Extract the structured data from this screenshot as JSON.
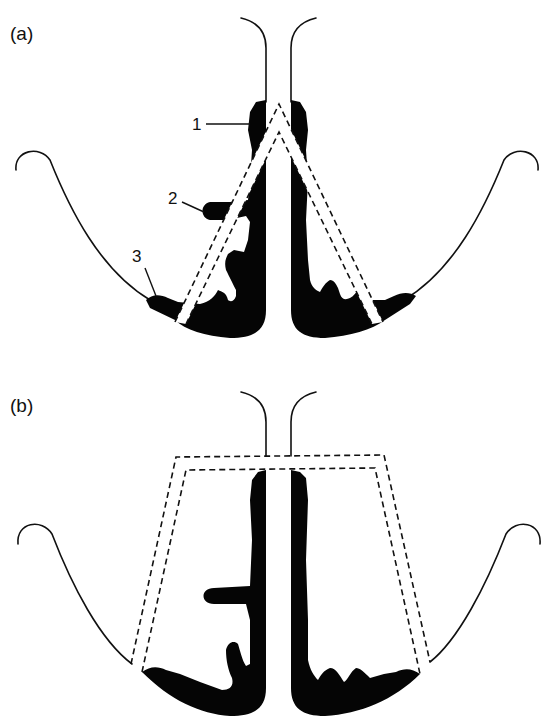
{
  "figure": {
    "panels": [
      {
        "id": "a",
        "label": "(a)",
        "callouts": [
          {
            "number": "1"
          },
          {
            "number": "2"
          },
          {
            "number": "3"
          }
        ],
        "cut_shape": "inverted V (wedge) excision, dashed outline"
      },
      {
        "id": "b",
        "label": "(b)",
        "callouts": [],
        "cut_shape": "trapezoidal excision, dashed outline"
      }
    ],
    "colors": {
      "deposit": "#050505",
      "outline": "#111111",
      "background": "#ffffff"
    }
  }
}
